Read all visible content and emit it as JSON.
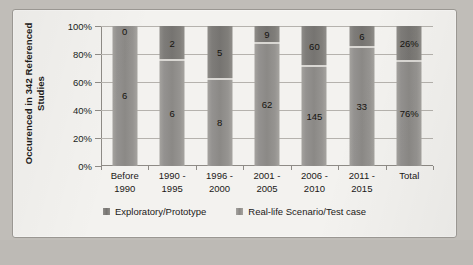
{
  "chart_data": {
    "type": "bar",
    "subtype": "stacked-100-percent",
    "title": "",
    "xlabel": "",
    "ylabel": "Occurenced in 342 Referenced Studies",
    "ylim": [
      0,
      100
    ],
    "ytick_labels": [
      "0%",
      "20%",
      "40%",
      "60%",
      "80%",
      "100%"
    ],
    "ytick_values": [
      0,
      20,
      40,
      60,
      80,
      100
    ],
    "grid": true,
    "legend_position": "bottom",
    "categories": [
      "Before 1990",
      "1990 - 1995",
      "1996 - 2000",
      "2001 - 2005",
      "2006 - 2010",
      "2011 - 2015",
      "Total"
    ],
    "category_lines": [
      [
        "Before",
        "1990"
      ],
      [
        "1990 -",
        "1995"
      ],
      [
        "1996 -",
        "2000"
      ],
      [
        "2001 -",
        "2005"
      ],
      [
        "2006 -",
        "2010"
      ],
      [
        "2011 -",
        "2015"
      ],
      [
        "Total",
        ""
      ]
    ],
    "series": [
      {
        "name": "Exploratory/Prototype",
        "color": "#7e7c79",
        "values": [
          0,
          2,
          5,
          9,
          60,
          6,
          26
        ],
        "labels": [
          "0",
          "2",
          "5",
          "9",
          "60",
          "6",
          "26%"
        ],
        "percents": [
          0,
          25,
          38.5,
          12.7,
          29.3,
          15.4,
          26
        ]
      },
      {
        "name": "Real-life Scenario/Test case",
        "color": "#8b8986",
        "values": [
          6,
          6,
          8,
          62,
          145,
          33,
          76
        ],
        "labels": [
          "6",
          "6",
          "8",
          "62",
          "145",
          "33",
          "76%"
        ],
        "percents": [
          100,
          75,
          61.5,
          87.3,
          70.7,
          84.6,
          74
        ]
      }
    ]
  },
  "legend": {
    "items": [
      {
        "label": "Exploratory/Prototype",
        "swatch": "legend-swatch-exploratory"
      },
      {
        "label": "Real-life Scenario/Test case",
        "swatch": "legend-swatch-reallife"
      }
    ]
  }
}
